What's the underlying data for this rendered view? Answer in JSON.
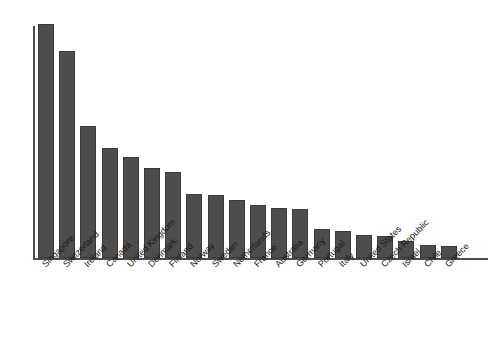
{
  "chart_data": {
    "type": "bar",
    "title": "",
    "subtitle": "",
    "xlabel": "",
    "ylabel": "",
    "grid": false,
    "legend": false,
    "legend_position": "none",
    "axis_color": "#4d4d4d",
    "bar_color": "#4d4d4d",
    "background_color": "#ffffff",
    "ylim": [
      0,
      230
    ],
    "y_tick_labels": [],
    "x_tick_rotation": -45,
    "categories": [
      "Singapore",
      "Switzerland",
      "Ireland",
      "Canada",
      "United Kingdom",
      "Denmark",
      "Finland",
      "Norway",
      "Sweden",
      "Netherlands",
      "France",
      "Australia",
      "Germany",
      "Portugal",
      "Italy",
      "United States",
      "Czech Republic",
      "Israel",
      "Chile",
      "Greece"
    ],
    "values": [
      230,
      203,
      130,
      108,
      99,
      88,
      85,
      63,
      62,
      57,
      52,
      49,
      48,
      29,
      27,
      23,
      22,
      17,
      13,
      12
    ]
  }
}
